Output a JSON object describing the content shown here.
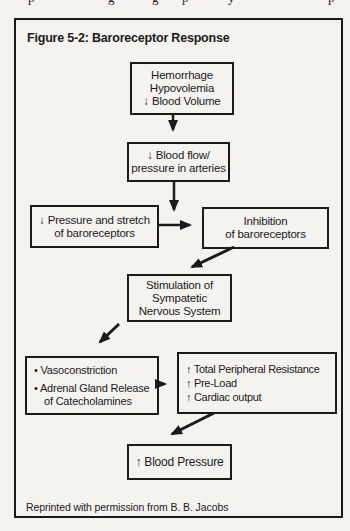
{
  "page_top": {
    "fragments": [
      {
        "glyph": "p",
        "x": 28
      },
      {
        "glyph": "g",
        "x": 108
      },
      {
        "glyph": "g",
        "x": 152
      },
      {
        "glyph": "p",
        "x": 182
      },
      {
        "glyph": "y",
        "x": 228
      },
      {
        "glyph": "p",
        "x": 328
      }
    ]
  },
  "figure": {
    "title": "Figure 5-2: Baroreceptor Response",
    "caption": "Reprinted with permission from B. B. Jacobs",
    "boxes": {
      "hemorrhage": {
        "lines": [
          "Hemorrhage",
          "Hypovolemia",
          "↓ Blood Volume"
        ]
      },
      "blood_flow": {
        "lines": [
          "↓ Blood flow/",
          "pressure in arteries"
        ]
      },
      "pressure": {
        "lines": [
          "↓ Pressure and stretch",
          "of baroreceptors"
        ]
      },
      "inhibition": {
        "lines": [
          "Inhibition",
          "of baroreceptors"
        ]
      },
      "stimulation": {
        "lines": [
          "Stimulation of",
          "Sympatetic",
          "Nervous System"
        ]
      },
      "effectors": {
        "lines": [
          "• Vasoconstriction",
          "• Adrenal Gland Release",
          "of Catecholamines"
        ]
      },
      "outcomes": {
        "lines": [
          "↑ Total Peripheral Resistance",
          "↑ Pre-Load",
          "↑ Cardiac output"
        ]
      },
      "blood_pressure": {
        "lines": [
          "↑ Blood Pressure"
        ]
      }
    }
  },
  "colors": {
    "paper": "#f4f3ef",
    "ink": "#1b1b1b"
  }
}
